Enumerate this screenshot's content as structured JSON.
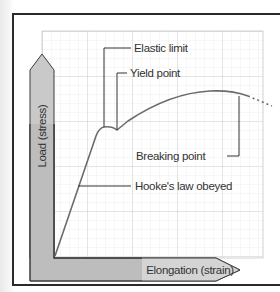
{
  "diagram": {
    "y_axis_label": "Load (stress)",
    "x_axis_label": "Elongation (strain)",
    "annotations": [
      {
        "id": "elastic-limit",
        "text": "Elastic limit"
      },
      {
        "id": "yield-point",
        "text": "Yield point"
      },
      {
        "id": "breaking-point",
        "text": "Breaking point"
      },
      {
        "id": "hookes-law",
        "text": "Hooke's law obeyed"
      }
    ],
    "colors": {
      "grid_minor": "#e4e4e4",
      "grid_major": "#cfcfcf",
      "curve": "#6b6b6b",
      "leader_line": "#333333",
      "axis_arrow_fill": "#cfcfcf",
      "axis_arrow_stroke": "#444444",
      "frame": "#2a2a2a"
    }
  }
}
